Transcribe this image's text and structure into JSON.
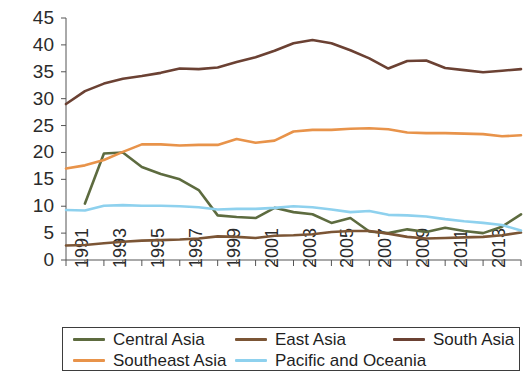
{
  "chart_data": {
    "type": "line",
    "title": "",
    "subtitle": "",
    "xlabel": "",
    "ylabel": "",
    "xlim": [
      1991,
      2015
    ],
    "ylim": [
      0,
      45
    ],
    "ytick_labels": [
      "0",
      "5",
      "10",
      "15",
      "20",
      "25",
      "30",
      "35",
      "40",
      "45"
    ],
    "yticks": [
      0,
      5,
      10,
      15,
      20,
      25,
      30,
      35,
      40,
      45
    ],
    "xtick_labels": [
      "1991",
      "1993",
      "1995",
      "1997",
      "1999",
      "2001",
      "2003",
      "2005",
      "2007",
      "2009",
      "2011",
      "2013",
      "2015"
    ],
    "xticks": [
      1991,
      1993,
      1995,
      1997,
      1999,
      2001,
      2003,
      2005,
      2007,
      2009,
      2011,
      2013,
      2015
    ],
    "grid": false,
    "legend_position": "bottom",
    "x": [
      1991,
      1992,
      1993,
      1994,
      1995,
      1996,
      1997,
      1998,
      1999,
      2000,
      2001,
      2002,
      2003,
      2004,
      2005,
      2006,
      2007,
      2008,
      2009,
      2010,
      2011,
      2012,
      2013,
      2014,
      2015
    ],
    "series": [
      {
        "name": "Central Asia",
        "color": "#5d6b3f",
        "values": [
          null,
          10.5,
          19.8,
          20.0,
          17.3,
          16.0,
          15.0,
          13.0,
          8.3,
          8.0,
          7.8,
          9.7,
          8.9,
          8.5,
          6.9,
          7.8,
          5.3,
          5.0,
          5.7,
          5.2,
          6.0,
          5.4,
          5.0,
          6.2,
          8.5
        ]
      },
      {
        "name": "East Asia",
        "color": "#7b5535",
        "values": [
          2.7,
          2.8,
          3.1,
          3.4,
          3.6,
          3.7,
          3.8,
          4.0,
          4.4,
          4.3,
          4.1,
          4.5,
          4.6,
          4.8,
          5.2,
          5.4,
          5.4,
          4.9,
          4.3,
          4.0,
          4.1,
          4.2,
          4.3,
          4.6,
          5.1
        ]
      },
      {
        "name": "South Asia",
        "color": "#6b4133",
        "values": [
          29.0,
          31.4,
          32.8,
          33.7,
          34.2,
          34.8,
          35.6,
          35.5,
          35.8,
          36.8,
          37.7,
          38.9,
          40.3,
          40.9,
          40.3,
          39.0,
          37.5,
          35.6,
          37.0,
          37.1,
          35.7,
          35.3,
          34.9,
          35.2,
          35.5
        ]
      },
      {
        "name": "Southeast Asia",
        "color": "#e8934a",
        "values": [
          17.0,
          17.6,
          18.6,
          20.1,
          21.5,
          21.5,
          21.3,
          21.4,
          21.4,
          22.5,
          21.8,
          22.2,
          23.9,
          24.2,
          24.2,
          24.4,
          24.5,
          24.3,
          23.7,
          23.6,
          23.6,
          23.5,
          23.4,
          23.0,
          23.2
        ]
      },
      {
        "name": "Pacific and Oceania",
        "color": "#8ed1ee",
        "values": [
          9.3,
          9.2,
          10.1,
          10.2,
          10.1,
          10.1,
          10.0,
          9.8,
          9.4,
          9.5,
          9.5,
          9.7,
          10.0,
          9.8,
          9.4,
          8.9,
          9.1,
          8.4,
          8.3,
          8.1,
          7.6,
          7.2,
          6.9,
          6.5,
          5.5
        ]
      }
    ]
  },
  "legend": {
    "rows": [
      [
        {
          "label": "Central Asia",
          "color": "#5d6b3f"
        },
        {
          "label": "East Asia",
          "color": "#7b5535"
        },
        {
          "label": "South Asia",
          "color": "#6b4133"
        }
      ],
      [
        {
          "label": "Southeast Asia",
          "color": "#e8934a"
        },
        {
          "label": "Pacific and Oceania",
          "color": "#8ed1ee"
        }
      ]
    ]
  }
}
